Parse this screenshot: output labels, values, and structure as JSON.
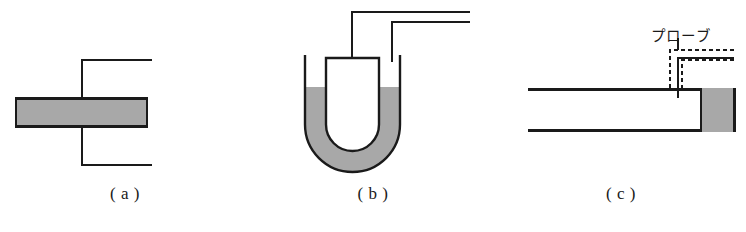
{
  "figure": {
    "width": 746,
    "height": 232,
    "background": "#ffffff",
    "stroke_color": "#1a1a1a",
    "fill_gray": "#a8a8a8",
    "fill_gray_edge": "#8f8f8f"
  },
  "panels": [
    {
      "id": "a",
      "caption": "( a )",
      "caption_x": 0,
      "caption_y": 184,
      "description": "gray slab with vertical probe line and two horizontal leads",
      "geometry": {
        "slab": {
          "x": 15,
          "y": 97,
          "width": 133,
          "height": 31
        },
        "vertical_line_x": 82,
        "vertical_top_y": 60,
        "vertical_bottom_y": 165,
        "lead_top_y": 60,
        "lead_bottom_y": 165,
        "lead_right_x": 152
      }
    },
    {
      "id": "b",
      "caption": "( b )",
      "caption_x": 250,
      "caption_y": 184,
      "description": "U-tube manometer with gray liquid and two lead wires",
      "geometry": {
        "outer_left_x": 305,
        "outer_right_x": 400,
        "inner_left_x": 326,
        "inner_right_x": 379,
        "tube_top_y": 55,
        "inner_top_y": 58,
        "liquid_level_y": 87,
        "bottom_y": 172,
        "lead_inner_x": 352,
        "lead_inner_top_y": 12,
        "lead_outer_x": 392,
        "lead_outer_top_y": 22,
        "lead_right_x": 470
      }
    },
    {
      "id": "c",
      "caption": "( c )",
      "caption_x": 496,
      "caption_y": 184,
      "description": "duct cross-section with probe inserted near gray end block",
      "label": "プローブ",
      "label_x": 651,
      "label_y": 24,
      "geometry": {
        "duct_left_x": 528,
        "duct_right_x": 736,
        "duct_top_y": 88,
        "duct_bottom_y": 132,
        "gray_block": {
          "x": 700,
          "y": 88,
          "width": 36,
          "height": 44
        },
        "probe_dashed_outer": {
          "x": 670,
          "y": 50,
          "right_x": 734,
          "down_y": 90
        },
        "probe_dashed_inner": {
          "x": 682,
          "y": 60,
          "right_x": 734,
          "down_y": 88
        },
        "probe_solid_x": 678,
        "probe_solid_top_y": 58,
        "probe_solid_right_x": 734,
        "leader_line_x": 678,
        "leader_line_top_y": 38
      }
    }
  ]
}
